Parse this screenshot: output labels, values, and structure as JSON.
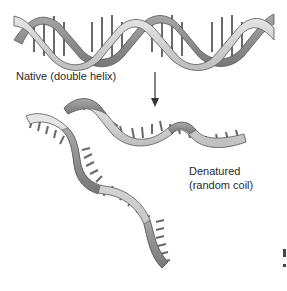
{
  "diagram": {
    "labels": {
      "native": "Native (double helix)",
      "denatured_line1": "Denatured",
      "denatured_line2": "(random coil)"
    },
    "colors": {
      "strand_light": "#d4d4d4",
      "strand_dark": "#8e8e8e",
      "outline": "#555555",
      "base_pair": "#6a6a6a",
      "arrow": "#333333",
      "text": "#2a2a2a"
    },
    "nodes": [
      {
        "id": "native-helix",
        "label": "Native (double helix)"
      },
      {
        "id": "denatured-strands",
        "label": "Denatured (random coil)"
      }
    ],
    "edges": [
      {
        "from": "native-helix",
        "to": "denatured-strands",
        "type": "arrow-down"
      }
    ]
  }
}
